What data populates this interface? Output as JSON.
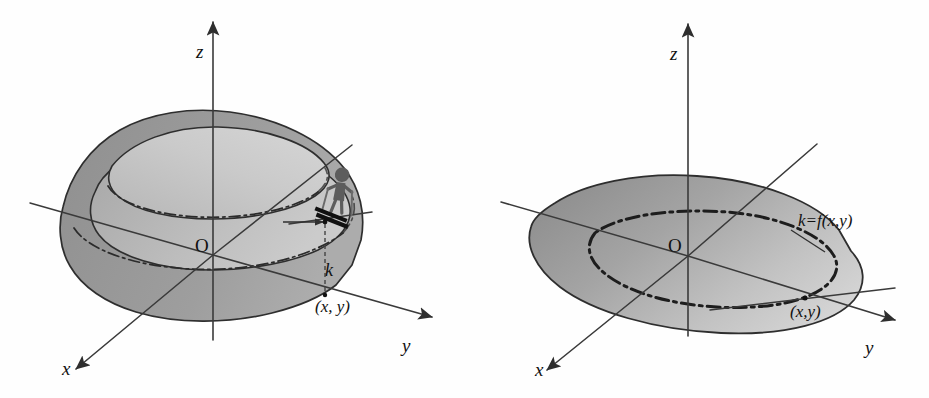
{
  "figure": {
    "panel_count": 2,
    "background_color": "#fefefe"
  },
  "colors": {
    "surface_dark": "#9a9a9a",
    "surface_light": "#c9c9c9",
    "surface_mid": "#b3b3b3",
    "ink": "#2e2e2e",
    "skier": "#5d5d5d"
  },
  "left_panel": {
    "name": "surface-with-skier",
    "axes": [
      {
        "id": "z",
        "label": "z",
        "direction": "up"
      },
      {
        "id": "y",
        "label": "y",
        "direction": "down-right"
      },
      {
        "id": "x",
        "label": "x",
        "direction": "down-left"
      }
    ],
    "origin_label": "O",
    "annotations": [
      {
        "id": "height",
        "label": "k"
      },
      {
        "id": "point",
        "label": "(x, y)"
      }
    ],
    "icons": [
      "skier-icon"
    ]
  },
  "right_panel": {
    "name": "surface-with-level-curve",
    "axes": [
      {
        "id": "z",
        "label": "z",
        "direction": "up"
      },
      {
        "id": "y",
        "label": "y",
        "direction": "down-right"
      },
      {
        "id": "x",
        "label": "x",
        "direction": "down-left"
      }
    ],
    "origin_label": "O",
    "annotations": [
      {
        "id": "level-curve",
        "label": "k=f(x,y)"
      },
      {
        "id": "point",
        "label": "(x,y)"
      }
    ],
    "icons": []
  }
}
